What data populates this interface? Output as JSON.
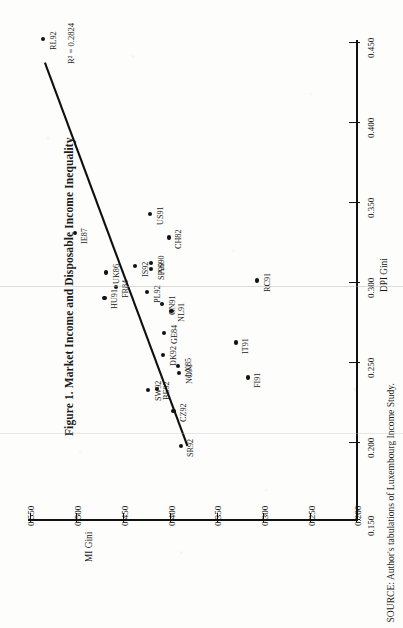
{
  "figure": {
    "title": "Figure 1. Market Income and Disposable Income Inequality",
    "source": "SOURCE: Author's tabulations of Luxembourg Income Study.",
    "r2_text": "R² = 0.2824"
  },
  "chart_data": {
    "type": "scatter",
    "title": "Figure 1. Market Income and Disposable Income Inequality",
    "xlabel": "DPI Gini",
    "ylabel": "MI Gini",
    "xlim": [
      0.15,
      0.45
    ],
    "ylim": [
      0.2,
      0.55
    ],
    "xticks": [
      "0.150",
      "0.200",
      "0.250",
      "0.300",
      "0.350",
      "0.400",
      "0.450"
    ],
    "yticks": [
      "0.200",
      "0.250",
      "0.300",
      "0.350",
      "0.400",
      "0.450",
      "0.500",
      "0.550"
    ],
    "grid": false,
    "legend": false,
    "annotations": [
      "R² = 0.2824"
    ],
    "trendline": {
      "type": "linear",
      "r_squared": 0.2824,
      "x_from": 0.437,
      "y_from": 0.534,
      "x_to": 0.196,
      "y_to": 0.381
    },
    "points": [
      {
        "label": "RL92",
        "x": 0.452,
        "y": 0.536
      },
      {
        "label": "IE87",
        "x": 0.33,
        "y": 0.502
      },
      {
        "label": "HU91",
        "x": 0.289,
        "y": 0.47
      },
      {
        "label": "UK86",
        "x": 0.305,
        "y": 0.468
      },
      {
        "label": "FR84",
        "x": 0.296,
        "y": 0.458
      },
      {
        "label": "IS92",
        "x": 0.309,
        "y": 0.437
      },
      {
        "label": "PL92",
        "x": 0.293,
        "y": 0.424
      },
      {
        "label": "US91",
        "x": 0.342,
        "y": 0.421
      },
      {
        "label": "AS90",
        "x": 0.311,
        "y": 0.42
      },
      {
        "label": "SP90",
        "x": 0.307,
        "y": 0.42
      },
      {
        "label": "CH82",
        "x": 0.327,
        "y": 0.401
      },
      {
        "label": "CN91",
        "x": 0.285,
        "y": 0.408
      },
      {
        "label": "NL91",
        "x": 0.281,
        "y": 0.398
      },
      {
        "label": "GE84",
        "x": 0.267,
        "y": 0.406
      },
      {
        "label": "DK92",
        "x": 0.253,
        "y": 0.407
      },
      {
        "label": "SW92",
        "x": 0.231,
        "y": 0.423
      },
      {
        "label": "BE92",
        "x": 0.232,
        "y": 0.414
      },
      {
        "label": "LX85",
        "x": 0.246,
        "y": 0.391
      },
      {
        "label": "NO91",
        "x": 0.242,
        "y": 0.39
      },
      {
        "label": "CZ92",
        "x": 0.218,
        "y": 0.396
      },
      {
        "label": "SR92",
        "x": 0.196,
        "y": 0.388
      },
      {
        "label": "IT91",
        "x": 0.261,
        "y": 0.329
      },
      {
        "label": "FI91",
        "x": 0.239,
        "y": 0.316
      },
      {
        "label": "RC91",
        "x": 0.3,
        "y": 0.306
      }
    ]
  }
}
